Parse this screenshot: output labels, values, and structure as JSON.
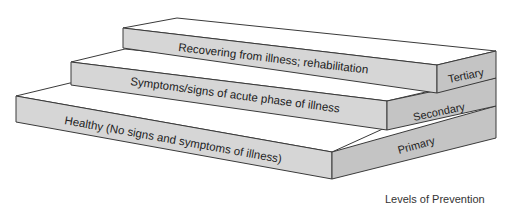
{
  "diagram": {
    "title": "Levels of Prevention",
    "levels": [
      {
        "name": "Primary",
        "description": "Healthy (No signs and symptoms of illness)",
        "order": 1
      },
      {
        "name": "Secondary",
        "description": "Symptoms/signs of acute phase of illness",
        "order": 2
      },
      {
        "name": "Tertiary",
        "description": "Recovering from illness; rehabilitation",
        "order": 3
      }
    ],
    "colors": {
      "front_face": "#d6d6d6",
      "side_face": "#c4c4c4",
      "top_face": "#ffffff",
      "outline": "#3a3a3a"
    }
  }
}
